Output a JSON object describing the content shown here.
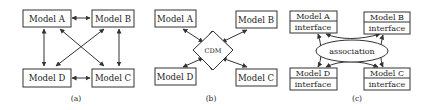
{
  "panels": [
    {
      "id": "a",
      "caption": "(a)",
      "description": "Point-to-point: every model connects directly to every other model",
      "models": [
        "Model A",
        "Model B",
        "Model C",
        "Model D"
      ]
    },
    {
      "id": "b",
      "caption": "(b)",
      "description": "Hub: every model connects to a central CDM",
      "hub_label": "CDM",
      "models": [
        "Model A",
        "Model B",
        "Model C",
        "Model D"
      ]
    },
    {
      "id": "c",
      "caption": "(c)",
      "description": "Interfaces connected through an association",
      "hub_label": "association",
      "interface_label": "interface",
      "models": [
        "Model A",
        "Model B",
        "Model C",
        "Model D"
      ]
    }
  ],
  "colors": {
    "stroke": "#333333",
    "text": "#222222",
    "background": "#ffffff"
  }
}
